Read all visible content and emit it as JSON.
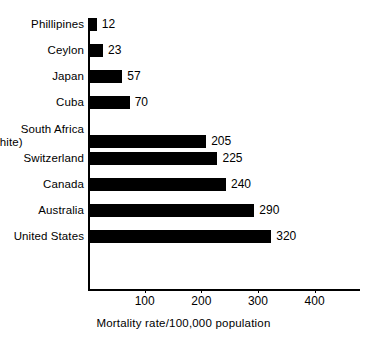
{
  "chart_data": {
    "type": "bar",
    "orientation": "horizontal",
    "title": "",
    "xlabel": "Mortality rate/100,000 population",
    "ylabel": "",
    "categories": [
      "Phillipines",
      "Ceylon",
      "Japan",
      "Cuba",
      "South Africa (white)",
      "Switzerland",
      "Canada",
      "Australia",
      "United States"
    ],
    "values": [
      12,
      23,
      57,
      70,
      205,
      225,
      240,
      290,
      320
    ],
    "value_labels": [
      "12",
      "23",
      "57",
      "70",
      "205",
      "225",
      "240",
      "290",
      "320"
    ],
    "xlim": [
      0,
      480
    ],
    "xticks": [
      100,
      200,
      300,
      400
    ],
    "xtick_labels": [
      "100",
      "200",
      "300",
      "400"
    ],
    "grid": false,
    "legend": null,
    "bar_color": "#000000",
    "background_color": "#ffffff"
  },
  "axis": {
    "caption": "Mortality rate/100,000 population",
    "ticks": [
      {
        "label": "100",
        "value": 100
      },
      {
        "label": "200",
        "value": 200
      },
      {
        "label": "300",
        "value": 300
      },
      {
        "label": "400",
        "value": 400
      }
    ]
  },
  "rows": [
    {
      "label": "Phillipines",
      "label_line2": "",
      "value": 12,
      "value_label": "12"
    },
    {
      "label": "Ceylon",
      "label_line2": "",
      "value": 23,
      "value_label": "23"
    },
    {
      "label": "Japan",
      "label_line2": "",
      "value": 57,
      "value_label": "57"
    },
    {
      "label": "Cuba",
      "label_line2": "",
      "value": 70,
      "value_label": "70"
    },
    {
      "label": "South Africa",
      "label_line2": "(white)",
      "value": 205,
      "value_label": "205"
    },
    {
      "label": "Switzerland",
      "label_line2": "",
      "value": 225,
      "value_label": "225"
    },
    {
      "label": "Canada",
      "label_line2": "",
      "value": 240,
      "value_label": "240"
    },
    {
      "label": "Australia",
      "label_line2": "",
      "value": 290,
      "value_label": "290"
    },
    {
      "label": "United States",
      "label_line2": "",
      "value": 320,
      "value_label": "320"
    }
  ]
}
